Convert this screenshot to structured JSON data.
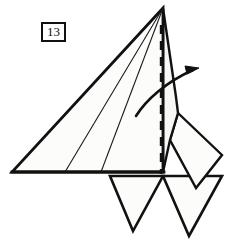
{
  "diagram": {
    "kind": "origami-fold-step",
    "step_number": "13",
    "canvas": {
      "width": 234,
      "height": 251
    },
    "colors": {
      "ink": "#111111",
      "paper_fill": "#fcfcfb",
      "paper_fill_alt": "#f7f7f6",
      "background": "#ffffff",
      "crease_line": "#1a1a1a"
    },
    "line_weights": {
      "outline": 2.6,
      "inner_edge": 2.0,
      "crease": 1.1,
      "dashed_fold": 2.4,
      "arrow": 2.6
    },
    "shapes": {
      "main_body": {
        "name": "main-triangle-body",
        "points": "163,8 12,172 163,172",
        "note": "large left-pointing triangular body panel"
      },
      "upper_right_panel": {
        "name": "upper-right-panel",
        "points": "163,8 176,97 178,113 170,140 163,172",
        "note": "narrow panel right of the dashed fold line"
      },
      "right_wing": {
        "name": "right-wing-quadrilateral",
        "points": "178,113 222,155 196,188 170,140",
        "note": "angled wing flap on the right side"
      },
      "flap_left": {
        "name": "lower-left-flap",
        "points": "110,176 163,176 133,231",
        "note": "downward pointing triangular flap, left"
      },
      "flap_right": {
        "name": "lower-right-flap",
        "points": "163,176 222,176 189,236",
        "note": "downward pointing triangular flap, right"
      }
    },
    "creases": [
      {
        "name": "crease-line-upper",
        "from": [
          163,
          8
        ],
        "to": [
          65,
          172
        ]
      },
      {
        "name": "crease-line-lower",
        "from": [
          163,
          8
        ],
        "to": [
          101,
          172
        ]
      }
    ],
    "fold_line": {
      "name": "dashed-fold-line",
      "label": "valley/mountain fold axis",
      "from": [
        161,
        25
      ],
      "to": [
        161,
        174
      ],
      "dash_pattern": "9 7"
    },
    "fold_arrow": {
      "name": "fold-direction-arrow",
      "label": "fold right",
      "path": "M136,116 C146,100 166,82 193,70",
      "head_tip": [
        199,
        68
      ],
      "direction": "right"
    },
    "baseline": {
      "name": "body-base-edge",
      "from": [
        12,
        172
      ],
      "to": [
        163,
        172
      ]
    }
  }
}
